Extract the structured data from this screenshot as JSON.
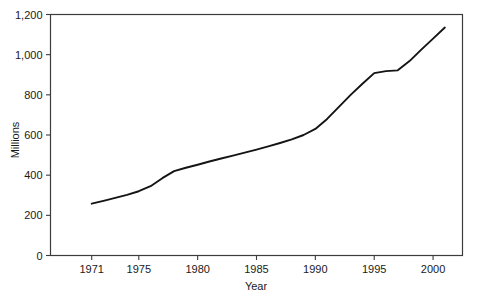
{
  "chart_data": {
    "type": "line",
    "title": "",
    "subtitle": "",
    "xlabel": "Year",
    "ylabel": "Millions",
    "xlim": [
      1967.5,
      2002.5
    ],
    "ylim": [
      0,
      1200
    ],
    "grid": false,
    "legend": null,
    "x_ticks": [
      1971,
      1975,
      1980,
      1985,
      1990,
      1995,
      2000
    ],
    "x_tick_labels": [
      "1971",
      "1975",
      "1980",
      "1985",
      "1990",
      "1995",
      "2000"
    ],
    "y_ticks": [
      0,
      200,
      400,
      600,
      800,
      1000,
      1200
    ],
    "y_tick_labels": [
      "0",
      "200",
      "400",
      "600",
      "800",
      "1,000",
      "1,200"
    ],
    "series": [
      {
        "name": "",
        "x": [
          1971,
          1972,
          1973,
          1974,
          1975,
          1976,
          1977,
          1978,
          1979,
          1980,
          1981,
          1982,
          1983,
          1984,
          1985,
          1986,
          1987,
          1988,
          1989,
          1990,
          1991,
          1992,
          1993,
          1994,
          1995,
          1996,
          1997,
          1998,
          1999,
          2000,
          2001
        ],
        "values": [
          258,
          272,
          287,
          302,
          320,
          345,
          385,
          420,
          437,
          452,
          468,
          483,
          497,
          512,
          527,
          543,
          560,
          578,
          600,
          630,
          680,
          740,
          800,
          855,
          908,
          918,
          922,
          968,
          1025,
          1080,
          1135
        ]
      }
    ]
  },
  "axes": {
    "y_axis_label": "Millions",
    "x_axis_label": "Year"
  }
}
